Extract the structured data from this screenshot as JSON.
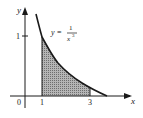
{
  "figure": {
    "type": "area-under-curve",
    "function_label": {
      "lhs": "y =",
      "numerator": "1",
      "denominator": "x",
      "exponent": "3"
    },
    "axes": {
      "x_label": "x",
      "y_label": "y",
      "origin_label": "0",
      "x_ticks": [
        "1",
        "3"
      ],
      "y_ticks": [
        "1"
      ]
    },
    "shaded_interval": {
      "from": "1",
      "to": "3"
    },
    "colors": {
      "line": "#1a1a1a",
      "shade": "#9a9a9a",
      "background": "#ffffff"
    }
  }
}
